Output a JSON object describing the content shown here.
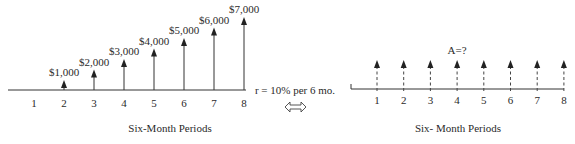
{
  "left_diagram": {
    "caption": "Six-Month Periods",
    "periods": [
      "1",
      "2",
      "3",
      "4",
      "5",
      "6",
      "7",
      "8"
    ],
    "cash_flows": [
      {
        "period": 2,
        "label": "$1,000",
        "value": 1000
      },
      {
        "period": 3,
        "label": "$2,000",
        "value": 2000
      },
      {
        "period": 4,
        "label": "$3,000",
        "value": 3000
      },
      {
        "period": 5,
        "label": "$4,000",
        "value": 4000
      },
      {
        "period": 6,
        "label": "$5,000",
        "value": 5000
      },
      {
        "period": 7,
        "label": "$6,000",
        "value": 6000
      },
      {
        "period": 8,
        "label": "$7,000",
        "value": 7000
      }
    ]
  },
  "equivalence": {
    "rate_label": "r = 10% per 6 mo.",
    "symbol": "double-arrow"
  },
  "right_diagram": {
    "caption": "Six- Month Periods",
    "annuity_label": "A=?",
    "periods": [
      "1",
      "2",
      "3",
      "4",
      "5",
      "6",
      "7",
      "8"
    ],
    "arrow_style": "dashed"
  },
  "colors": {
    "line": "#333333",
    "text": "#2a2a2a"
  }
}
